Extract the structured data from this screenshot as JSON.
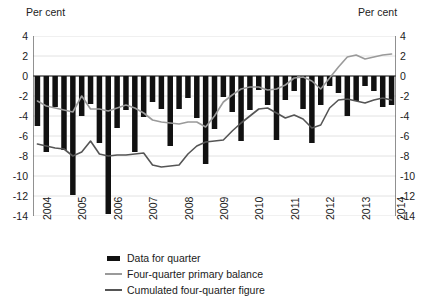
{
  "axis_unit_left": "Per cent",
  "axis_unit_right": "Per cent",
  "legend": {
    "items": [
      {
        "label": "Data for quarter",
        "key": "bar-swatch",
        "color": "#111111"
      },
      {
        "label": "Four-quarter primary balance",
        "key": "line-swatch",
        "color": "#9a9a9a"
      },
      {
        "label": "Cumulated four-quarter figure",
        "key": "line-swatch",
        "color": "#555555"
      }
    ]
  },
  "chart_data": {
    "type": "bar",
    "title": "",
    "subtitle": "",
    "xlabel": "",
    "ylabel": "Per cent",
    "ylim": [
      -14,
      4
    ],
    "yticks": [
      4,
      2,
      0,
      -2,
      -4,
      -6,
      -8,
      -10,
      -12,
      -14
    ],
    "ytick_labels": [
      "4",
      "2",
      "0",
      "-2",
      "-4",
      "-6",
      "-8",
      "-10",
      "-12",
      "-14"
    ],
    "y2lim": [
      -14,
      4
    ],
    "y2ticks": [
      4,
      2,
      0,
      -2,
      -4,
      -6,
      -8,
      -10,
      -12,
      -14
    ],
    "y2tick_labels": [
      "4",
      "2",
      "0",
      "-2",
      "-4",
      "-6",
      "-8",
      "-10",
      "-12",
      "-14"
    ],
    "grid": true,
    "grid_axis": "y",
    "legend_position": "bottom",
    "xtick_labels": [
      "2004",
      "2005",
      "2006",
      "2007",
      "2008",
      "2009",
      "2010",
      "2011",
      "2012",
      "2013",
      "2014"
    ],
    "xtick_values": [
      "2004Q1",
      "2005Q1",
      "2006Q1",
      "2007Q1",
      "2008Q1",
      "2009Q1",
      "2010Q1",
      "2011Q1",
      "2012Q1",
      "2013Q1",
      "2014Q1"
    ],
    "x": [
      "2004Q1",
      "2004Q2",
      "2004Q3",
      "2004Q4",
      "2005Q1",
      "2005Q2",
      "2005Q3",
      "2005Q4",
      "2006Q1",
      "2006Q2",
      "2006Q3",
      "2006Q4",
      "2007Q1",
      "2007Q2",
      "2007Q3",
      "2007Q4",
      "2008Q1",
      "2008Q2",
      "2008Q3",
      "2008Q4",
      "2009Q1",
      "2009Q2",
      "2009Q3",
      "2009Q4",
      "2010Q1",
      "2010Q2",
      "2010Q3",
      "2010Q4",
      "2011Q1",
      "2011Q2",
      "2011Q3",
      "2011Q4",
      "2012Q1",
      "2012Q2",
      "2012Q3",
      "2012Q4",
      "2013Q1",
      "2013Q2",
      "2013Q3",
      "2013Q4",
      "2014Q1"
    ],
    "series": [
      {
        "name": "Data for quarter",
        "type": "bar",
        "color": "#111111",
        "values": [
          -5.0,
          -7.6,
          -3.1,
          -7.4,
          -11.9,
          -4.0,
          -2.8,
          -6.7,
          -13.8,
          -5.2,
          -3.4,
          -7.6,
          -4.1,
          -2.6,
          -3.3,
          -7.0,
          -3.3,
          -2.2,
          -4.2,
          -8.8,
          -5.3,
          -2.1,
          -3.6,
          -6.5,
          -3.4,
          -1.4,
          -2.9,
          -6.4,
          -2.4,
          -1.5,
          -3.3,
          -6.7,
          -2.9,
          -1.0,
          -1.7,
          -4.0,
          -2.5,
          -1.0,
          -1.5,
          -3.1,
          -2.9
        ]
      },
      {
        "name": "Four-quarter primary balance",
        "type": "line",
        "color": "#9a9a9a",
        "values": [
          -2.5,
          -3.0,
          -3.2,
          -3.4,
          -3.6,
          -2.0,
          -3.3,
          -3.3,
          -3.5,
          -3.2,
          -2.9,
          -3.2,
          -3.7,
          -4.4,
          -4.6,
          -4.7,
          -4.8,
          -4.6,
          -4.6,
          -5.1,
          -4.0,
          -2.6,
          -1.9,
          -1.3,
          -1.1,
          -1.1,
          -1.4,
          -1.3,
          -0.9,
          -0.2,
          -0.1,
          -0.5,
          -1.3,
          -0.2,
          0.9,
          1.9,
          2.1,
          1.7,
          1.9,
          2.1,
          2.2
        ]
      },
      {
        "name": "Cumulated four-quarter figure",
        "type": "line",
        "color": "#555555",
        "values": [
          -6.8,
          -7.0,
          -7.2,
          -7.3,
          -8.0,
          -7.6,
          -6.5,
          -7.8,
          -8.0,
          -7.9,
          -7.9,
          -7.8,
          -7.7,
          -8.9,
          -9.1,
          -9.0,
          -8.9,
          -7.8,
          -7.0,
          -6.6,
          -6.5,
          -6.4,
          -5.5,
          -4.7,
          -4.0,
          -3.3,
          -3.2,
          -3.7,
          -4.2,
          -3.9,
          -4.3,
          -5.2,
          -4.9,
          -3.2,
          -2.4,
          -2.3,
          -2.5,
          -2.7,
          -2.4,
          -2.2,
          -2.4
        ]
      }
    ]
  }
}
